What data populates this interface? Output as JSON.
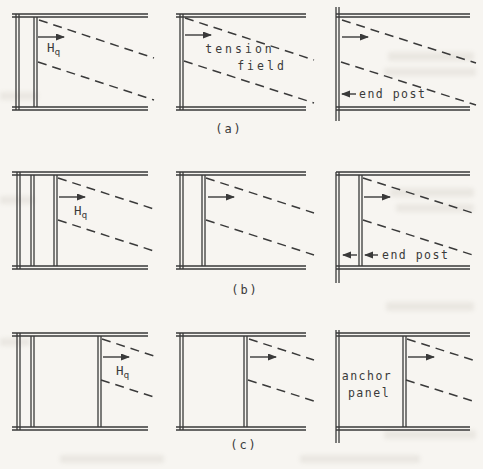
{
  "colors": {
    "ink": "#3a3a3a",
    "paper": "#f7f5f1"
  },
  "labels": {
    "hq_main": "H",
    "hq_sub": "q",
    "tension_line1": "tension",
    "tension_line2": "field",
    "end_post": "end post",
    "anchor_line1": "anchor",
    "anchor_line2": "panel",
    "row_a": "(a)",
    "row_b": "(b)",
    "row_c": "(c)"
  }
}
